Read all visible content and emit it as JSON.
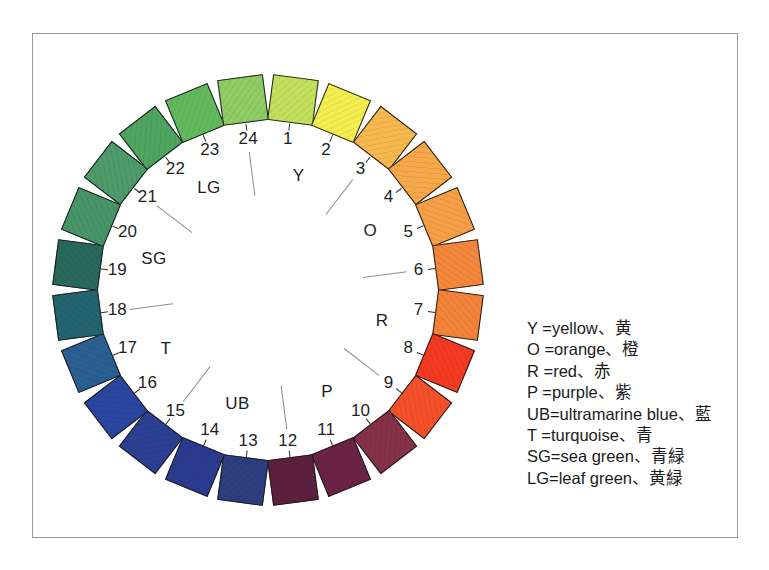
{
  "frame": {
    "border_color": "#9a9a9a"
  },
  "wheel": {
    "center_x": 268,
    "center_y": 290,
    "swatch_radius": 192,
    "number_radius": 152,
    "swatch_size": 46,
    "count": 24,
    "swatches": [
      {
        "n": "1",
        "color": "#C3E05C",
        "angle": -82.5
      },
      {
        "n": "2",
        "color": "#F5EE50",
        "angle": -67.5
      },
      {
        "n": "3",
        "color": "#F8B84E",
        "angle": -52.5
      },
      {
        "n": "4",
        "color": "#F7A848",
        "angle": -37.5
      },
      {
        "n": "5",
        "color": "#F59E46",
        "angle": -22.5
      },
      {
        "n": "6",
        "color": "#F4873C",
        "angle": -7.5
      },
      {
        "n": "7",
        "color": "#F4833A",
        "angle": 7.5
      },
      {
        "n": "8",
        "color": "#F43A22",
        "angle": 22.5
      },
      {
        "n": "9",
        "color": "#F4512A",
        "angle": 37.5
      },
      {
        "n": "10",
        "color": "#86304A",
        "angle": 52.5
      },
      {
        "n": "11",
        "color": "#6B2246",
        "angle": 67.5
      },
      {
        "n": "12",
        "color": "#5D1F3F",
        "angle": 82.5
      },
      {
        "n": "13",
        "color": "#2E3C80",
        "angle": 97.5
      },
      {
        "n": "14",
        "color": "#2A3A8F",
        "angle": 112.5
      },
      {
        "n": "15",
        "color": "#2B3F93",
        "angle": 127.5
      },
      {
        "n": "16",
        "color": "#2946A0",
        "angle": 142.5
      },
      {
        "n": "17",
        "color": "#2A5F92",
        "angle": 157.5
      },
      {
        "n": "18",
        "color": "#246471",
        "angle": 172.5
      },
      {
        "n": "19",
        "color": "#29685C",
        "angle": 187.5
      },
      {
        "n": "20",
        "color": "#469468",
        "angle": 202.5
      },
      {
        "n": "21",
        "color": "#4E9A6A",
        "angle": 217.5
      },
      {
        "n": "22",
        "color": "#4FA45F",
        "angle": 232.5
      },
      {
        "n": "23",
        "color": "#62B95B",
        "angle": 247.5
      },
      {
        "n": "24",
        "color": "#8FCC63",
        "angle": 262.5
      }
    ],
    "hue_groups": [
      {
        "code": "Y",
        "angle": -75,
        "radius": 118
      },
      {
        "code": "O",
        "angle": -30,
        "radius": 118
      },
      {
        "code": "R",
        "angle": 15,
        "radius": 118
      },
      {
        "code": "P",
        "angle": 60,
        "radius": 118
      },
      {
        "code": "UB",
        "angle": 105,
        "radius": 118
      },
      {
        "code": "T",
        "angle": 150,
        "radius": 118
      },
      {
        "code": "SG",
        "angle": 195,
        "radius": 118
      },
      {
        "code": "LG",
        "angle": 240,
        "radius": 118
      }
    ],
    "dividers": [
      {
        "angle": -52.5
      },
      {
        "angle": -7.5
      },
      {
        "angle": 37.5
      },
      {
        "angle": 82.5
      },
      {
        "angle": 127.5
      },
      {
        "angle": 172.5
      },
      {
        "angle": 217.5
      },
      {
        "angle": 262.5
      }
    ]
  },
  "legend": {
    "entries": [
      "Y =yellow、黄",
      "O =orange、橙",
      "R =red、赤",
      "P =purple、紫",
      "UB=ultramarine blue、藍",
      "T =turquoise、青",
      "SG=sea green、青緑",
      "LG=leaf green、黄緑"
    ]
  }
}
